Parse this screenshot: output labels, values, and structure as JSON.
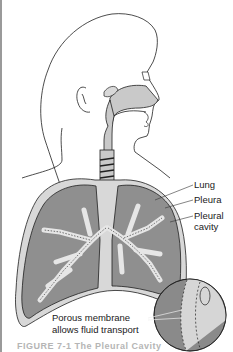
{
  "figure": {
    "labels": {
      "lung": "Lung",
      "pleura": "Pleura",
      "pleural_cavity_line1": "Pleural",
      "pleural_cavity_line2": "cavity",
      "porous_line1": "Porous membrane",
      "porous_line2": "allows fluid transport"
    },
    "caption_partial": "FIGURE 7-1  The Pleural Cavity"
  },
  "colors": {
    "background": "#ffffff",
    "lung_fill": "#8f8f8f",
    "airway_fill": "#c9c9c9",
    "pleura_fill": "#d8d8d8",
    "outline": "#1f1f1f",
    "inset_dark": "#8a8a8a",
    "inset_light": "#d6d6d6"
  }
}
